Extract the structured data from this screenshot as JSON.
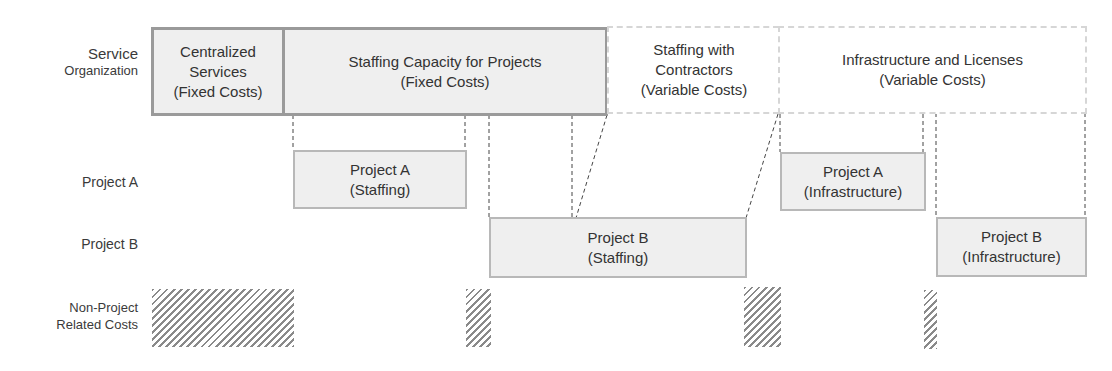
{
  "row_labels": {
    "service_org_line1": "Service",
    "service_org_line2": "Organization",
    "project_a": "Project A",
    "project_b": "Project B",
    "non_project_line1": "Non-Project",
    "non_project_line2": "Related Costs"
  },
  "service_boxes": [
    {
      "line1": "Centralized",
      "line2": "Services",
      "line3": "(Fixed Costs)",
      "style": "fixed"
    },
    {
      "line1": "Staffing Capacity for Projects",
      "line2": "(Fixed Costs)",
      "style": "fixed"
    },
    {
      "line1": "Staffing with",
      "line2": "Contractors",
      "line3": "(Variable Costs)",
      "style": "variable"
    },
    {
      "line1": "Infrastructure and Licenses",
      "line2": "(Variable Costs)",
      "style": "variable"
    }
  ],
  "project_boxes": [
    {
      "line1": "Project A",
      "line2": "(Staffing)"
    },
    {
      "line1": "Project B",
      "line2": "(Staffing)"
    },
    {
      "line1": "Project A",
      "line2": "(Infrastructure)"
    },
    {
      "line1": "Project B",
      "line2": "(Infrastructure)"
    }
  ],
  "colors": {
    "fixed_fill": "#efefef",
    "fixed_border": "#9a9a9a",
    "variable_border": "#d6d6d6",
    "hatch": "#8a8a8a",
    "connector": "#444444"
  }
}
